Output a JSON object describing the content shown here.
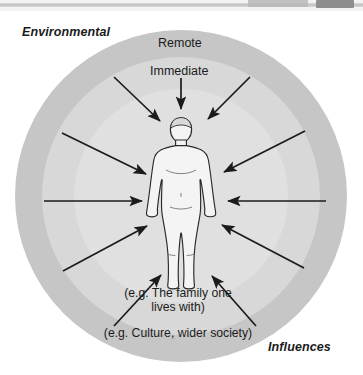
{
  "top_strip": {
    "rule": "toolbar-rule",
    "field": "address-field-fragment",
    "button": "toolbar-button-fragment"
  },
  "diagram": {
    "title_left": "Environmental",
    "title_right": "Influences",
    "ring_outer_label": "Remote",
    "ring_inner_label": "Immediate",
    "example_inner": "(e.g. The family one lives with)",
    "example_outer": "(e.g. Culture, wider society)",
    "center_figure": "human-body-outline",
    "colors": {
      "outer_ring": "#c6c6c6",
      "inner_ring": "#d8d8d8",
      "core": "#e0e0e0",
      "figure_fill": "#f2f2f2",
      "figure_stroke": "#2a2a2a",
      "arrow": "#1b1b1b",
      "page_background": "#ffffff"
    },
    "arrow_count": 12,
    "arrow_direction": "inward-toward-center-figure"
  }
}
